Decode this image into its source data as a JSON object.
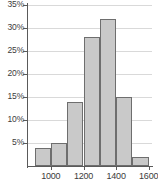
{
  "chart_data": {
    "type": "bar",
    "title": "",
    "subtitle": "",
    "xlabel": "",
    "ylabel": "",
    "grid": true,
    "legend": false,
    "bin_width": 100,
    "bin_edges": [
      900,
      1000,
      1100,
      1200,
      1300,
      1400,
      1500,
      1600
    ],
    "categories": [
      "900-1000",
      "1000-1100",
      "1100-1200",
      "1200-1300",
      "1300-1400",
      "1400-1500",
      "1500-1600"
    ],
    "bin_starts": [
      900,
      1000,
      1100,
      1200,
      1300,
      1400,
      1500
    ],
    "values": [
      4,
      5,
      14,
      28,
      32,
      15,
      2
    ],
    "value_labels": [
      "4%",
      "5%",
      "14%",
      "28%",
      "32%",
      "15%",
      "2%"
    ],
    "xlim": [
      860,
      1620
    ],
    "ylim": [
      0,
      35
    ],
    "x_ticks": [
      1000,
      1200,
      1400,
      1600
    ],
    "x_tick_labels": [
      "1000",
      "1200",
      "1400",
      "1600"
    ],
    "y_ticks": [
      5,
      10,
      15,
      20,
      25,
      30,
      35
    ],
    "y_tick_labels": [
      "5%",
      "10%",
      "15%",
      "20%",
      "25%",
      "30%",
      "35%"
    ],
    "colors": {
      "bar_fill": "#c9c9c9",
      "bar_border": "#6e6e6e",
      "gridline": "#d9d9d9",
      "axis": "#5a5a5a",
      "text": "#3c3c3c",
      "background": "#ffffff"
    }
  }
}
